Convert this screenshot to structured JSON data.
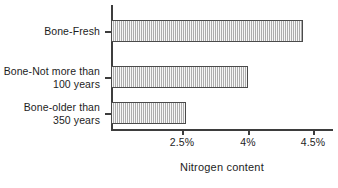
{
  "chart_data": {
    "type": "bar",
    "orientation": "horizontal",
    "title": "",
    "xlabel": "Nitrogen content",
    "ylabel": "",
    "grid": false,
    "legend": null,
    "categories": [
      "Bone-Fresh",
      "Bone-Not more than\n100 years",
      "Bone-older than\n350 years"
    ],
    "values": [
      4.4,
      4.0,
      2.5
    ],
    "value_labels": [
      "4.4%",
      "4%",
      "2.5%"
    ],
    "xticklabels": [
      "2.5%",
      "4%",
      "4.5%"
    ],
    "xtickvalues": [
      2.5,
      4,
      4.5
    ],
    "xlim": [
      0,
      4.68
    ],
    "axis_note": "x tick spacing is non-uniform: 2.5%, 4% and 4.5% are drawn equally spaced"
  },
  "colors": {
    "bar_fill": "#c9c9c9",
    "bar_edge": "#4a4a4a",
    "axis": "#3d3d3d",
    "text": "#1d1d1d",
    "background": "#ffffff"
  },
  "geometry": {
    "plot_left_px": 111,
    "tick_px": [
      182,
      248,
      313
    ],
    "bar_end_px": [
      303,
      248,
      186
    ],
    "bar_rows_px": [
      {
        "top": 20,
        "height": 22
      },
      {
        "top": 66,
        "height": 22
      },
      {
        "top": 102,
        "height": 22
      }
    ],
    "ytick_px": [
      31,
      77,
      113
    ],
    "ylabel_top_px": [
      25,
      65,
      101
    ]
  }
}
